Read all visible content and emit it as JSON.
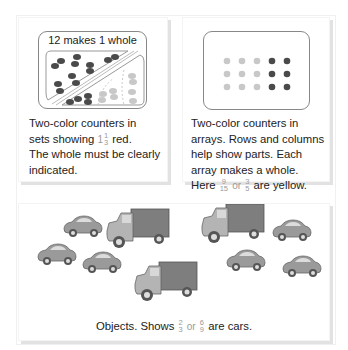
{
  "panels": [
    {
      "id": "sets",
      "box_label": "12 makes 1 whole",
      "caption_lines": [
        "Two-color counters in",
        "sets showing",
        "red.",
        "The whole must be clearly",
        "indicated."
      ],
      "fraction": {
        "whole": "1",
        "numerator": "1",
        "denominator": "3"
      },
      "counters": {
        "red_count": 16,
        "yellow_count": 8
      }
    },
    {
      "id": "arrays",
      "caption_lines": [
        "Two-color counters in",
        "arrays. Rows and columns",
        "help show parts. Each",
        "array makes a whole.",
        "Here",
        "are yellow."
      ],
      "fraction_a": {
        "numerator": "9",
        "denominator": "15"
      },
      "or_text": "or",
      "fraction_b": {
        "numerator": "3",
        "denominator": "5"
      },
      "array": {
        "rows": 3,
        "cols": 5,
        "yellow_cols": 3,
        "red_cols": 2
      }
    },
    {
      "id": "objects",
      "caption_prefix": "Objects. Shows",
      "fraction_a": {
        "numerator": "2",
        "denominator": "3"
      },
      "or_text": "or",
      "fraction_b": {
        "numerator": "6",
        "denominator": "9"
      },
      "caption_suffix": "are cars.",
      "objects": {
        "cars": 6,
        "trucks": 3
      }
    }
  ],
  "colors": {
    "red_counter": "#4a4a4a",
    "yellow_counter": "#c8c8c8",
    "box_border": "#888888",
    "fraction_text": "#9a9a9a"
  }
}
